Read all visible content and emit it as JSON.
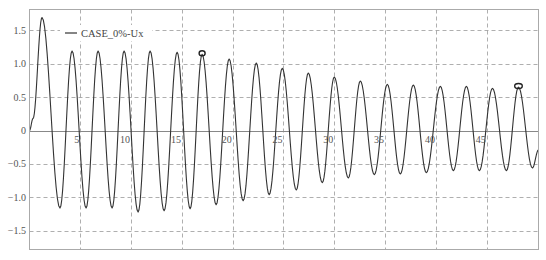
{
  "chart_data": {
    "type": "line",
    "title": "",
    "xlabel": "",
    "ylabel": "",
    "xlim": [
      0,
      50.1
    ],
    "ylim": [
      -1.78,
      1.81
    ],
    "grid": true,
    "grid_style": "dashed",
    "legend": {
      "placement": "top-left",
      "entries": [
        "CASE_0%-Ux"
      ]
    },
    "x_ticks": [
      5,
      10,
      15,
      20,
      25,
      30,
      35,
      40,
      45
    ],
    "x_tick_labels": [
      "5",
      "10",
      "15",
      "20",
      "25",
      "30",
      "35",
      "40",
      "45"
    ],
    "y_ticks": [
      1.5,
      1.0,
      0.5,
      0,
      -0.5,
      -1.0,
      -1.5
    ],
    "y_tick_labels": [
      "1.5",
      "1.0",
      "0.5",
      "0",
      "−0.5",
      "−1.0",
      "−1.5"
    ],
    "colors": {
      "line": "#333333",
      "grid": "#9a9a9a",
      "frame": "#aaaaaa",
      "zero_line": "#888888"
    },
    "series": [
      {
        "name": "CASE_0%-Ux",
        "points": [
          [
            0,
            0
          ],
          [
            0.35,
            0.18
          ],
          [
            1.23,
            1.69
          ],
          [
            3.0,
            -1.16
          ],
          [
            4.19,
            1.19
          ],
          [
            5.57,
            -1.16
          ],
          [
            6.75,
            1.19
          ],
          [
            8.13,
            -1.16
          ],
          [
            9.31,
            1.19
          ],
          [
            10.69,
            -1.22
          ],
          [
            11.87,
            1.19
          ],
          [
            13.25,
            -1.2
          ],
          [
            14.53,
            1.17
          ],
          [
            15.81,
            -1.17
          ],
          [
            16.99,
            1.14
          ],
          [
            18.37,
            -1.11
          ],
          [
            19.65,
            1.07
          ],
          [
            21.03,
            -1.05
          ],
          [
            22.32,
            1.01
          ],
          [
            23.59,
            -0.96
          ],
          [
            24.88,
            0.93
          ],
          [
            26.26,
            -0.89
          ],
          [
            27.44,
            0.86
          ],
          [
            28.82,
            -0.78
          ],
          [
            30.0,
            0.8
          ],
          [
            31.38,
            -0.71
          ],
          [
            32.56,
            0.74
          ],
          [
            33.94,
            -0.66
          ],
          [
            35.22,
            0.69
          ],
          [
            36.5,
            -0.65
          ],
          [
            37.78,
            0.68
          ],
          [
            39.06,
            -0.63
          ],
          [
            40.44,
            0.66
          ],
          [
            41.72,
            -0.6
          ],
          [
            43.0,
            0.66
          ],
          [
            44.28,
            -0.6
          ],
          [
            45.57,
            0.63
          ],
          [
            46.94,
            -0.6
          ],
          [
            48.13,
            0.65
          ],
          [
            49.5,
            -0.56
          ],
          [
            50.1,
            -0.29
          ]
        ]
      }
    ],
    "markers": [
      {
        "label": "peak-marker-1",
        "x": 16.99,
        "y": 1.14
      },
      {
        "label": "peak-marker-2",
        "x": 48.13,
        "y": 0.65
      }
    ]
  }
}
